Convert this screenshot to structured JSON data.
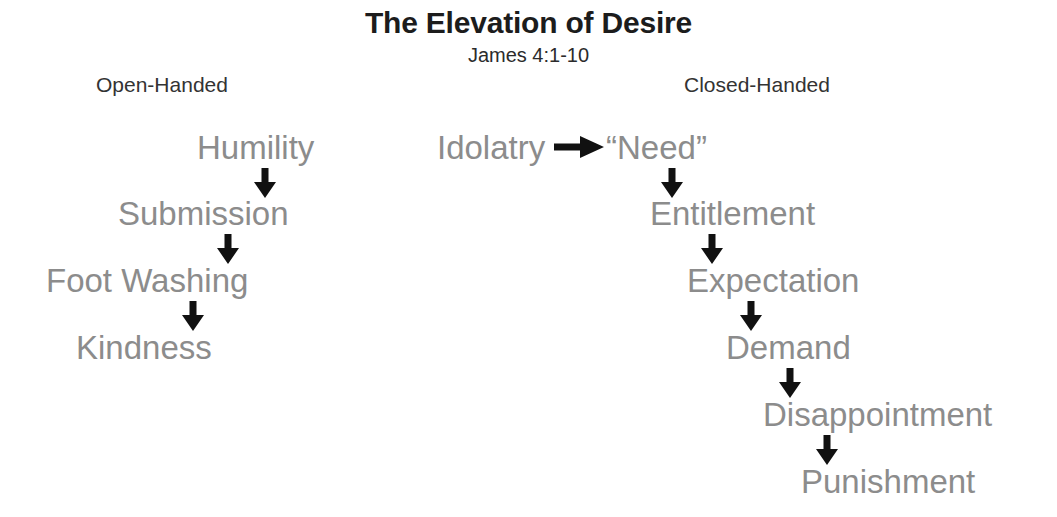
{
  "slide": {
    "title": "The Elevation of Desire",
    "subtitle": "James 4:1-10",
    "background_color": "#ffffff",
    "step_text_color": "#8c8c8c",
    "header_text_color": "#333333",
    "title_text_color": "#1c1c1c",
    "arrow_color": "#111111"
  },
  "columns": [
    {
      "id": "open-handed",
      "header": "Open-Handed",
      "steps": [
        {
          "label": "Humility"
        },
        {
          "label": "Submission"
        },
        {
          "label": "Foot Washing"
        },
        {
          "label": "Kindness"
        }
      ]
    },
    {
      "id": "closed-handed",
      "header": "Closed-Handed",
      "steps": [
        {
          "label": "Idolatry"
        },
        {
          "label": "“Need”"
        },
        {
          "label": "Entitlement"
        },
        {
          "label": "Expectation"
        },
        {
          "label": "Demand"
        },
        {
          "label": "Disappointment"
        },
        {
          "label": "Punishment"
        }
      ]
    }
  ],
  "arrows": {
    "down_icon": "arrow-down-icon",
    "right_icon": "arrow-right-icon",
    "left_chain": [
      {
        "from": "Humility",
        "to": "Submission"
      },
      {
        "from": "Submission",
        "to": "Foot Washing"
      },
      {
        "from": "Foot Washing",
        "to": "Kindness"
      }
    ],
    "right_chain": [
      {
        "from": "Idolatry",
        "to": "“Need”",
        "direction": "right"
      },
      {
        "from": "“Need”",
        "to": "Entitlement",
        "direction": "down"
      },
      {
        "from": "Entitlement",
        "to": "Expectation",
        "direction": "down"
      },
      {
        "from": "Expectation",
        "to": "Demand",
        "direction": "down"
      },
      {
        "from": "Demand",
        "to": "Disappointment",
        "direction": "down"
      },
      {
        "from": "Disappointment",
        "to": "Punishment",
        "direction": "down"
      }
    ]
  }
}
